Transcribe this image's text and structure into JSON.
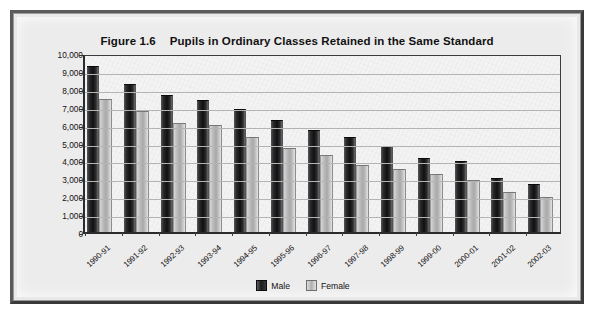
{
  "figure": {
    "number_label": "Figure 1.6",
    "title": "Pupils in Ordinary Classes Retained in the Same Standard"
  },
  "legend": {
    "position": "bottom-center",
    "entries": [
      {
        "label": "Male",
        "swatch": "dark-gray-swatch-icon",
        "color": "#1b1b1c"
      },
      {
        "label": "Female",
        "swatch": "light-gray-swatch-icon",
        "color": "#b0b0b0"
      }
    ]
  },
  "axes": {
    "y_tick_labels": [
      "10,000",
      "9,000",
      "8,000",
      "7,000",
      "6,000",
      "5,000",
      "4,000",
      "3,000",
      "2,000",
      "1,000",
      "0"
    ],
    "y_tick_values": [
      10000,
      9000,
      8000,
      7000,
      6000,
      5000,
      4000,
      3000,
      2000,
      1000,
      0
    ],
    "grid": true,
    "ylabel": "",
    "xlabel": ""
  },
  "chart_data": {
    "type": "bar",
    "xlabel": "",
    "ylabel": "",
    "ylim": [
      0,
      10000
    ],
    "ytick_step": 1000,
    "grid": true,
    "legend_position": "bottom-center",
    "categories": [
      "1990-91",
      "1991-92",
      "1992-93",
      "1993-94",
      "1994-95",
      "1995-96",
      "1996-97",
      "1997-98",
      "1998-99",
      "1999-00",
      "2000-01",
      "2001-02",
      "2002-03"
    ],
    "series": [
      {
        "name": "Male",
        "color": "#1b1b1c",
        "values": [
          9200,
          8200,
          7600,
          7300,
          6800,
          6200,
          5650,
          5250,
          4750,
          4100,
          3900,
          2950,
          2600
        ]
      },
      {
        "name": "Female",
        "color": "#b0b0b0",
        "values": [
          7400,
          6700,
          6050,
          5950,
          5250,
          4650,
          4250,
          3700,
          3450,
          3200,
          2850,
          2200,
          1900
        ]
      }
    ]
  }
}
